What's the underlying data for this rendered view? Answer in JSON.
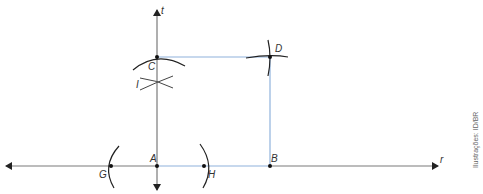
{
  "figure": {
    "lines": [
      {
        "name": "r",
        "label": "r",
        "direction": "horizontal"
      },
      {
        "name": "t",
        "label": "t",
        "direction": "vertical"
      }
    ],
    "points": [
      {
        "id": "A",
        "label": "A"
      },
      {
        "id": "B",
        "label": "B"
      },
      {
        "id": "C",
        "label": "C"
      },
      {
        "id": "D",
        "label": "D"
      },
      {
        "id": "G",
        "label": "G"
      },
      {
        "id": "H",
        "label": "H"
      },
      {
        "id": "I",
        "label": "I"
      }
    ],
    "segments_highlighted": [
      "AB",
      "BD",
      "CD"
    ],
    "credit": "Ilustrações: ID/BR"
  },
  "colors": {
    "axis": "#6e6e6e",
    "arc": "#222222",
    "highlight": "#7fa6d6",
    "point": "#111111"
  }
}
